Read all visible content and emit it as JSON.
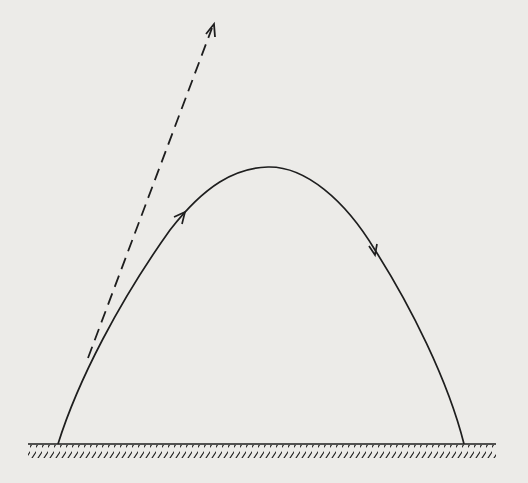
{
  "diagram": {
    "title": "Projectile trajectory with initial velocity direction",
    "colors": {
      "background": "#ecebe8",
      "ink": "#1e1e1e"
    },
    "elements": [
      {
        "id": "ground",
        "type": "hatched-ground-line",
        "from": [
          28,
          444
        ],
        "to": [
          496,
          444
        ]
      },
      {
        "id": "trajectory",
        "type": "parabolic-curve",
        "start": [
          58,
          444
        ],
        "peak": [
          268,
          167
        ],
        "end": [
          464,
          444
        ]
      },
      {
        "id": "velocity-vector",
        "type": "dashed-arrow",
        "from": [
          88,
          355
        ],
        "to": [
          214,
          24
        ]
      },
      {
        "id": "arrow-ascending",
        "type": "direction-arrow",
        "at": [
          183,
          215
        ],
        "direction": "up-right"
      },
      {
        "id": "arrow-descending",
        "type": "direction-arrow",
        "at": [
          375,
          252
        ],
        "direction": "down-right"
      }
    ]
  }
}
